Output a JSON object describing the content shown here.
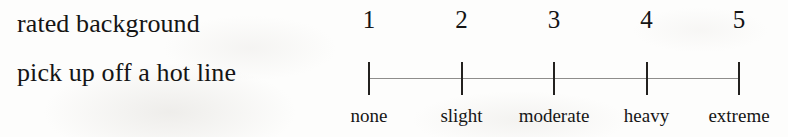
{
  "item": {
    "prompt_lines": [
      "rated background",
      "pick up off a hot line"
    ]
  },
  "scale": {
    "type": "likert-5",
    "points": [
      {
        "number": "1",
        "label": "none"
      },
      {
        "number": "2",
        "label": "slight"
      },
      {
        "number": "3",
        "label": "moderate"
      },
      {
        "number": "4",
        "label": "heavy"
      },
      {
        "number": "5",
        "label": "extreme"
      }
    ]
  },
  "colors": {
    "page_background": "#fdfdfc",
    "ink": "#151515",
    "axis_line": "#8e8d8b",
    "tick_mark": "#23211f"
  }
}
